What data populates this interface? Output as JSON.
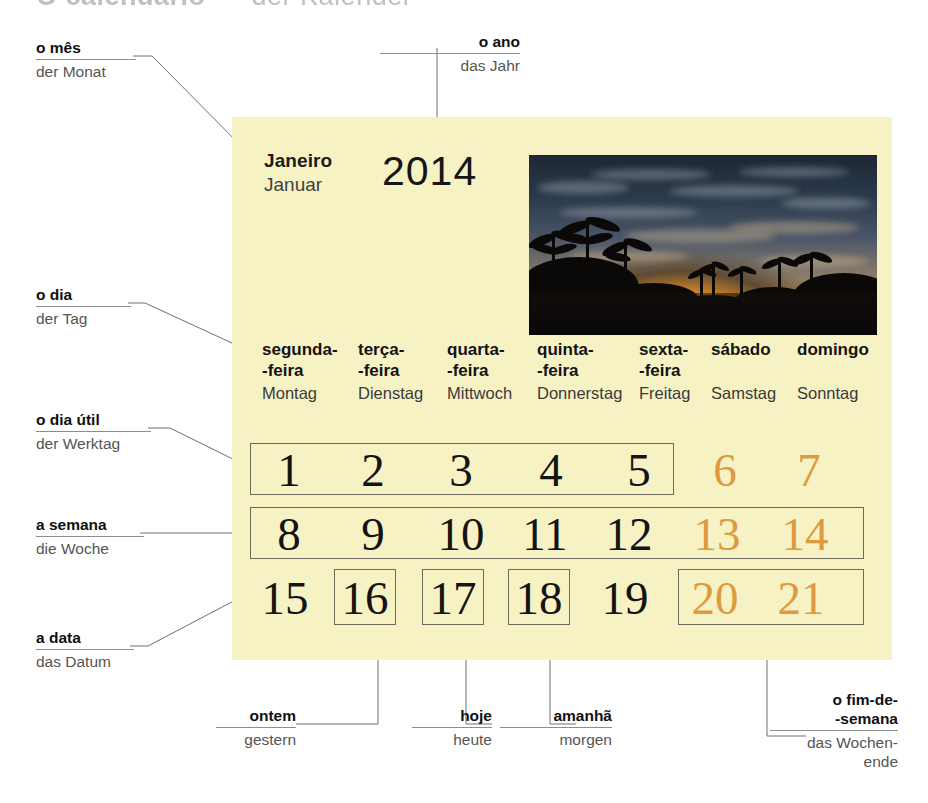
{
  "page": {
    "header_partial_pt": "O calendário",
    "header_partial_de": "der Kalender",
    "background": "#ffffff",
    "panel_color": "#f7f2c4",
    "weekend_color": "#dd9a3f",
    "text_color": "#141414"
  },
  "calendar": {
    "month_pt": "Janeiro",
    "month_de": "Januar",
    "year": "2014",
    "photo_alt": "sunset-palm-trees-photo",
    "weekdays": [
      {
        "pt": "segunda-\n-feira",
        "de": "Montag"
      },
      {
        "pt": "terça-\n-feira",
        "de": "Dienstag"
      },
      {
        "pt": "quarta-\n-feira",
        "de": "Mittwoch"
      },
      {
        "pt": "quinta-\n-feira",
        "de": "Donnerstag"
      },
      {
        "pt": "sexta-\n-feira",
        "de": "Freitag"
      },
      {
        "pt": "sábado",
        "de": "Samstag"
      },
      {
        "pt": "domingo",
        "de": "Sonntag"
      }
    ],
    "weeks": [
      [
        "1",
        "2",
        "3",
        "4",
        "5",
        "6",
        "7"
      ],
      [
        "8",
        "9",
        "10",
        "11",
        "12",
        "13",
        "14"
      ],
      [
        "15",
        "16",
        "17",
        "18",
        "19",
        "20",
        "21"
      ]
    ],
    "weekend_days": [
      "6",
      "7",
      "13",
      "14",
      "20",
      "21"
    ]
  },
  "annotations": {
    "month": {
      "pt": "o mês",
      "de": "der Monat"
    },
    "year": {
      "pt": "o ano",
      "de": "das Jahr"
    },
    "day": {
      "pt": "o dia",
      "de": "der Tag"
    },
    "weekday": {
      "pt": "o dia útil",
      "de": "der Werktag"
    },
    "week": {
      "pt": "a semana",
      "de": "die Woche"
    },
    "date": {
      "pt": "a data",
      "de": "das Datum"
    },
    "yesterday": {
      "pt": "ontem",
      "de": "gestern"
    },
    "today": {
      "pt": "hoje",
      "de": "heute"
    },
    "tomorrow": {
      "pt": "amanhã",
      "de": "morgen"
    },
    "weekend": {
      "pt": "o fim-de-\n-semana",
      "de": "das Wochen-\nende"
    }
  }
}
